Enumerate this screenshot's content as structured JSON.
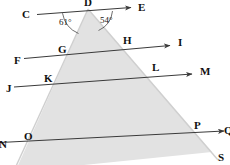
{
  "figure": {
    "type": "geometry-diagram",
    "background_color": "#ffffff",
    "shade_color": "#e2e2e2",
    "line_color": "#3a3a3a",
    "triangle_edge_color": "#cfcfcf",
    "label_color": "#111111"
  },
  "labels": {
    "D": "D",
    "C": "C",
    "E": "E",
    "F": "F",
    "G": "G",
    "H": "H",
    "I": "I",
    "J": "J",
    "K": "K",
    "L": "L",
    "M": "M",
    "N": "N",
    "O": "O",
    "P": "P",
    "Q": "Q",
    "S": "S"
  },
  "angles": {
    "left": "61°",
    "right": "54°"
  },
  "points": [
    {
      "name": "D",
      "x": 88,
      "y": 2,
      "clipped": true
    },
    {
      "name": "C",
      "x": 25,
      "y": 15
    },
    {
      "name": "E",
      "x": 142,
      "y": 8
    },
    {
      "name": "F",
      "x": 17,
      "y": 61
    },
    {
      "name": "G",
      "x": 62,
      "y": 51
    },
    {
      "name": "H",
      "x": 126,
      "y": 42
    },
    {
      "name": "I",
      "x": 181,
      "y": 44
    },
    {
      "name": "J",
      "x": 9,
      "y": 89
    },
    {
      "name": "K",
      "x": 47,
      "y": 80
    },
    {
      "name": "L",
      "x": 155,
      "y": 70
    },
    {
      "name": "M",
      "x": 204,
      "y": 73
    },
    {
      "name": "N",
      "x": 2,
      "y": 145,
      "clipped": true
    },
    {
      "name": "O",
      "x": 27,
      "y": 138
    },
    {
      "name": "P",
      "x": 197,
      "y": 127
    },
    {
      "name": "Q",
      "x": 225,
      "y": 131,
      "clipped": true
    },
    {
      "name": "S",
      "x": 221,
      "y": 158
    }
  ],
  "lines": [
    {
      "name": "line-CE",
      "from": "C",
      "to": "E",
      "arrow_at": "E"
    },
    {
      "name": "line-FI",
      "from": "F",
      "to": "I",
      "arrow_at": "I"
    },
    {
      "name": "line-JM",
      "from": "J",
      "to": "M",
      "arrow_at": "M"
    },
    {
      "name": "line-NQ",
      "from": "N",
      "to": "Q",
      "arrow_at": "Q"
    }
  ]
}
